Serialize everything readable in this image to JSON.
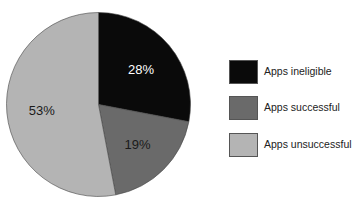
{
  "chart_data": {
    "type": "pie",
    "title": "",
    "categories": [
      "Apps ineligible",
      "Apps successful",
      "Apps unsuccessful"
    ],
    "values": [
      28,
      19,
      53
    ],
    "labels": [
      "28%",
      "19%",
      "53%"
    ],
    "colors": [
      "#0a0a0a",
      "#6a6a6a",
      "#b4b4b4"
    ],
    "label_colors": [
      "#ffffff",
      "#1a1a1a",
      "#1a1a1a"
    ],
    "start_angle": "12 o'clock, clockwise",
    "legend_position": "right"
  },
  "legend": {
    "items": [
      {
        "label": "Apps ineligible",
        "color": "#0a0a0a"
      },
      {
        "label": "Apps successful",
        "color": "#6a6a6a"
      },
      {
        "label": "Apps unsuccessful",
        "color": "#b4b4b4"
      }
    ]
  }
}
